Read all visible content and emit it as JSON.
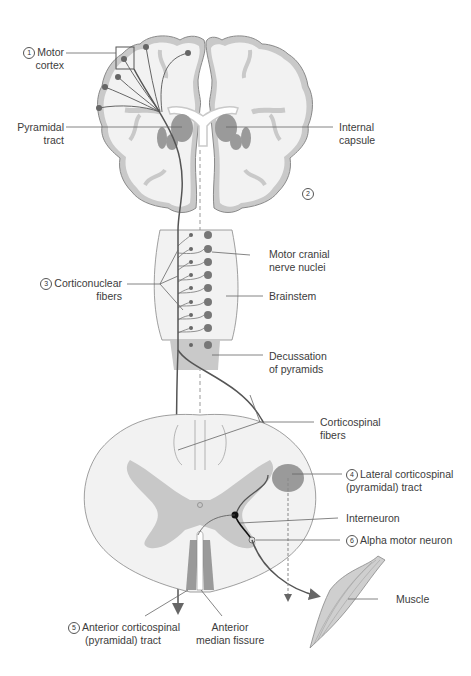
{
  "figure": {
    "colors": {
      "background": "#ffffff",
      "tissue_light": "#f1f1f1",
      "cortex_gray": "#c9c9c9",
      "nuclei_dark": "#8a8a8a",
      "tract_line": "#555555",
      "gray_matter": "#c8c8c8",
      "tract_area": "#9a9a9a",
      "leader_line": "#666666"
    }
  },
  "labels": {
    "motor_cortex": {
      "num": "1",
      "line1": "Motor",
      "line2": "cortex"
    },
    "pyramidal_tract": {
      "line1": "Pyramidal",
      "line2": "tract"
    },
    "internal_capsule": {
      "line1": "Internal",
      "line2": "capsule"
    },
    "marker_2": {
      "num": "2"
    },
    "motor_cranial_nerve_nuclei": {
      "line1": "Motor cranial",
      "line2": "nerve nuclei"
    },
    "corticonuclear_fibers": {
      "num": "3",
      "line1": "Corticonuclear",
      "line2": "fibers"
    },
    "brainstem": {
      "line1": "Brainstem"
    },
    "decussation_of_pyramids": {
      "line1": "Decussation",
      "line2": "of pyramids"
    },
    "corticospinal_fibers": {
      "line1": "Corticospinal",
      "line2": "fibers"
    },
    "lateral_corticospinal_tract": {
      "num": "4",
      "line1": "Lateral corticospinal",
      "line2": "(pyramidal) tract"
    },
    "interneuron": {
      "line1": "Interneuron"
    },
    "alpha_motor_neuron": {
      "num": "6",
      "line1": "Alpha motor neuron"
    },
    "muscle": {
      "line1": "Muscle"
    },
    "anterior_corticospinal_tract": {
      "num": "5",
      "line1": "Anterior corticospinal",
      "line2": "(pyramidal) tract"
    },
    "anterior_median_fissure": {
      "line1": "Anterior",
      "line2": "median fissure"
    }
  }
}
